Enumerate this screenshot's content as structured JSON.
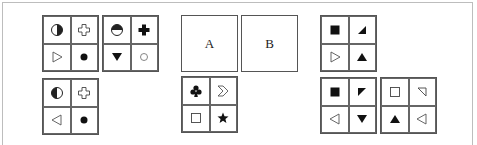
{
  "puzzle": {
    "left_group": {
      "grids": [
        {
          "id": "g1",
          "cells": [
            "circle-half-right-filled-icon",
            "cross-outline-icon",
            "triangle-right-outline-icon",
            "dot-filled-icon"
          ]
        },
        {
          "id": "g2",
          "cells": [
            "circle-half-top-filled-icon",
            "cross-filled-icon",
            "triangle-down-filled-icon",
            "circle-small-outline-icon"
          ]
        },
        {
          "id": "g3",
          "cells": [
            "circle-half-left-filled-icon",
            "cross-outline-icon",
            "triangle-left-outline-icon",
            "dot-filled-icon"
          ]
        }
      ]
    },
    "middle_group": {
      "box_a_label": "A",
      "box_b_label": "B",
      "grids": [
        {
          "id": "g4",
          "cells": [
            "club-filled-icon",
            "chevron-right-outline-icon",
            "square-outline-icon",
            "star-filled-icon"
          ]
        }
      ]
    },
    "right_group": {
      "grids": [
        {
          "id": "g5",
          "cells": [
            "square-filled-icon",
            "corner-triangle-bottom-right-filled-icon",
            "triangle-right-outline-icon",
            "triangle-up-filled-icon"
          ]
        },
        {
          "id": "g6",
          "cells": [
            "square-filled-icon",
            "corner-triangle-top-left-filled-icon",
            "triangle-left-outline-icon",
            "triangle-down-filled-icon"
          ]
        },
        {
          "id": "g7",
          "cells": [
            "square-outline-icon",
            "corner-triangle-top-right-outline-icon",
            "triangle-up-filled-icon",
            "triangle-left-outline-icon"
          ]
        }
      ]
    }
  },
  "colors": {
    "stroke": "#222222",
    "border": "#555555",
    "frame": "#bdbdbd"
  }
}
